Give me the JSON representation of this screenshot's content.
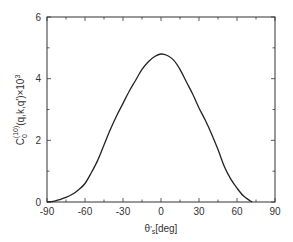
{
  "chart_data": {
    "type": "line",
    "title": "",
    "xlabel": "θ′s[deg]",
    "xlabel_parts": {
      "base": "θ",
      "prime": "′",
      "sub": "s",
      "unit": "[deg]"
    },
    "ylabel": "Ĉ0^(10)(q,k,q′)×10^3",
    "ylabel_parts": {
      "hat": "C",
      "sub": "0",
      "sup": "(10)",
      "args": "(q,k,q′)",
      "mult": "×10",
      "exp": "3"
    },
    "xlim": [
      -90,
      90
    ],
    "ylim": [
      0,
      6
    ],
    "xticks": [
      -90,
      -60,
      -30,
      0,
      30,
      60,
      90
    ],
    "xticklabels": [
      "-90",
      "-60",
      "-30",
      "0",
      "30",
      "60",
      "90"
    ],
    "x_minor_step": 15,
    "yticks": [
      0,
      2,
      4,
      6
    ],
    "yticklabels": [
      "0",
      "2",
      "4",
      "6"
    ],
    "y_minor_step": 1,
    "grid": false,
    "legend": null,
    "series": [
      {
        "name": "C0(10)",
        "color": "#222222",
        "x": [
          -90,
          -85,
          -80,
          -75,
          -70,
          -65,
          -60,
          -55,
          -50,
          -45,
          -40,
          -35,
          -30,
          -25,
          -20,
          -15,
          -10,
          -5,
          0,
          5,
          10,
          15,
          20,
          25,
          30,
          35,
          40,
          45,
          50,
          55,
          60,
          65,
          70,
          72
        ],
        "values": [
          0,
          0.02,
          0.08,
          0.15,
          0.25,
          0.4,
          0.6,
          0.95,
          1.35,
          1.85,
          2.35,
          2.8,
          3.2,
          3.6,
          3.95,
          4.3,
          4.55,
          4.72,
          4.8,
          4.75,
          4.6,
          4.3,
          3.9,
          3.5,
          3.05,
          2.65,
          2.2,
          1.7,
          1.15,
          0.75,
          0.45,
          0.2,
          0.05,
          0
        ]
      }
    ]
  }
}
